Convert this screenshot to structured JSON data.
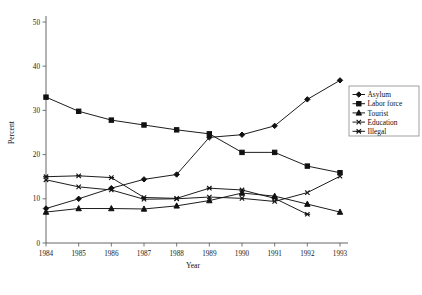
{
  "chart_data": {
    "type": "line",
    "title": "",
    "xlabel": "Year",
    "ylabel": "Percent",
    "categories": [
      1984,
      1985,
      1986,
      1987,
      1988,
      1989,
      1990,
      1991,
      1992,
      1993
    ],
    "x_tick_labels": [
      "1984",
      "1985",
      "1986",
      "1987",
      "1988",
      "1989",
      "1990",
      "1991",
      "1992",
      "1993"
    ],
    "y_tick_labels": [
      "0",
      "10",
      "20",
      "30",
      "40",
      "50"
    ],
    "y_ticks": [
      0,
      10,
      20,
      30,
      40,
      50
    ],
    "ylim": [
      0,
      50
    ],
    "xlim": [
      1984,
      1993
    ],
    "grid": false,
    "legend_position": "right",
    "series": [
      {
        "name": "Asylum",
        "marker": "diamond",
        "values": [
          7.8,
          10.0,
          12.4,
          14.4,
          15.5,
          23.9,
          24.5,
          26.5,
          32.5,
          36.8
        ]
      },
      {
        "name": "Labor force",
        "marker": "square",
        "values": [
          33.0,
          29.8,
          27.8,
          26.7,
          25.6,
          24.7,
          20.5,
          20.5,
          17.4,
          15.9
        ]
      },
      {
        "name": "Tourist",
        "marker": "triangle",
        "values": [
          7.0,
          7.8,
          7.8,
          7.7,
          8.4,
          9.6,
          11.3,
          10.6,
          8.8,
          7.0
        ]
      },
      {
        "name": "Education",
        "marker": "x",
        "values": [
          14.3,
          12.7,
          12.0,
          9.9,
          10.0,
          10.4,
          10.1,
          9.4,
          11.4,
          15.1
        ]
      },
      {
        "name": "Illegal",
        "marker": "star",
        "values": [
          15.0,
          15.2,
          14.8,
          10.3,
          10.1,
          12.4,
          12.0,
          10.1,
          6.5,
          null
        ]
      }
    ]
  },
  "legend": {
    "entries": [
      "Asylum",
      "Labor force",
      "Tourist",
      "Education",
      "Illegal"
    ]
  }
}
